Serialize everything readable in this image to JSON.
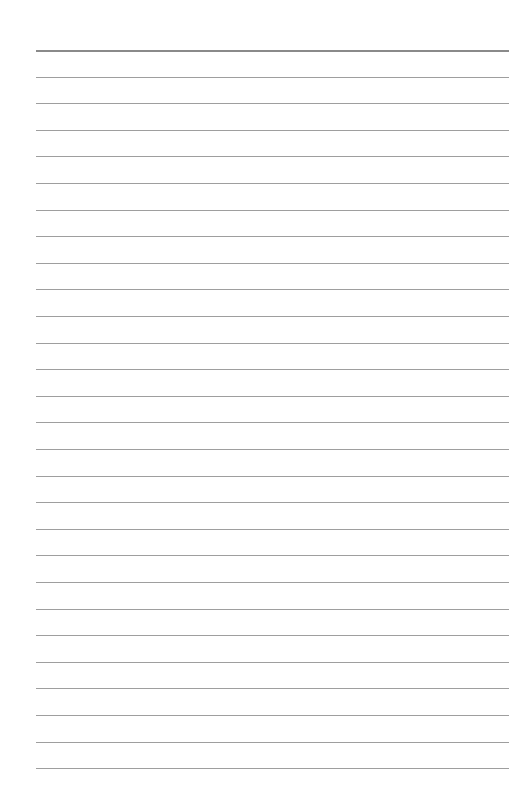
{
  "page": {
    "background_color": "#ffffff",
    "width": 513,
    "height": 793,
    "content_text": "",
    "orientation": "portrait"
  },
  "ruling": {
    "type": "horizontal-ruled-lines",
    "line_count": 28,
    "left_margin_px": 36,
    "right_edge_px": 509,
    "line_length_px": 473,
    "first_line_y_px": 50,
    "line_spacing_px": 26.6,
    "header_rule": {
      "index": 0,
      "y_px": 50,
      "thickness_px": 2,
      "color": "#8a8a8a",
      "label": "header-rule"
    },
    "body_rule_style": {
      "thickness_px": 1,
      "color": "#9e9e9e"
    },
    "lines": [
      {
        "index": 0,
        "y": 50.0,
        "type": "header",
        "color": "#8a8a8a",
        "thickness": 2,
        "text": ""
      },
      {
        "index": 1,
        "y": 76.6,
        "type": "body",
        "color": "#9e9e9e",
        "thickness": 1,
        "text": ""
      },
      {
        "index": 2,
        "y": 103.2,
        "type": "body",
        "color": "#9e9e9e",
        "thickness": 1,
        "text": ""
      },
      {
        "index": 3,
        "y": 129.8,
        "type": "body",
        "color": "#9e9e9e",
        "thickness": 1,
        "text": ""
      },
      {
        "index": 4,
        "y": 156.4,
        "type": "body",
        "color": "#9e9e9e",
        "thickness": 1,
        "text": ""
      },
      {
        "index": 5,
        "y": 183.0,
        "type": "body",
        "color": "#9e9e9e",
        "thickness": 1,
        "text": ""
      },
      {
        "index": 6,
        "y": 209.6,
        "type": "body",
        "color": "#9e9e9e",
        "thickness": 1,
        "text": ""
      },
      {
        "index": 7,
        "y": 236.2,
        "type": "body",
        "color": "#9e9e9e",
        "thickness": 1,
        "text": ""
      },
      {
        "index": 8,
        "y": 262.8,
        "type": "body",
        "color": "#9e9e9e",
        "thickness": 1,
        "text": ""
      },
      {
        "index": 9,
        "y": 289.4,
        "type": "body",
        "color": "#9e9e9e",
        "thickness": 1,
        "text": ""
      },
      {
        "index": 10,
        "y": 316.0,
        "type": "body",
        "color": "#9e9e9e",
        "thickness": 1,
        "text": ""
      },
      {
        "index": 11,
        "y": 342.6,
        "type": "body",
        "color": "#9e9e9e",
        "thickness": 1,
        "text": ""
      },
      {
        "index": 12,
        "y": 369.2,
        "type": "body",
        "color": "#9e9e9e",
        "thickness": 1,
        "text": ""
      },
      {
        "index": 13,
        "y": 395.8,
        "type": "body",
        "color": "#9e9e9e",
        "thickness": 1,
        "text": ""
      },
      {
        "index": 14,
        "y": 422.4,
        "type": "body",
        "color": "#9e9e9e",
        "thickness": 1,
        "text": ""
      },
      {
        "index": 15,
        "y": 449.0,
        "type": "body",
        "color": "#9e9e9e",
        "thickness": 1,
        "text": ""
      },
      {
        "index": 16,
        "y": 475.6,
        "type": "body",
        "color": "#9e9e9e",
        "thickness": 1,
        "text": ""
      },
      {
        "index": 17,
        "y": 502.2,
        "type": "body",
        "color": "#9e9e9e",
        "thickness": 1,
        "text": ""
      },
      {
        "index": 18,
        "y": 528.8,
        "type": "body",
        "color": "#9e9e9e",
        "thickness": 1,
        "text": ""
      },
      {
        "index": 19,
        "y": 555.4,
        "type": "body",
        "color": "#9e9e9e",
        "thickness": 1,
        "text": ""
      },
      {
        "index": 20,
        "y": 582.0,
        "type": "body",
        "color": "#9e9e9e",
        "thickness": 1,
        "text": ""
      },
      {
        "index": 21,
        "y": 608.6,
        "type": "body",
        "color": "#9e9e9e",
        "thickness": 1,
        "text": ""
      },
      {
        "index": 22,
        "y": 635.2,
        "type": "body",
        "color": "#9e9e9e",
        "thickness": 1,
        "text": ""
      },
      {
        "index": 23,
        "y": 661.8,
        "type": "body",
        "color": "#9e9e9e",
        "thickness": 1,
        "text": ""
      },
      {
        "index": 24,
        "y": 688.4,
        "type": "body",
        "color": "#9e9e9e",
        "thickness": 1,
        "text": ""
      },
      {
        "index": 25,
        "y": 715.0,
        "type": "body",
        "color": "#9e9e9e",
        "thickness": 1,
        "text": ""
      },
      {
        "index": 26,
        "y": 741.6,
        "type": "body",
        "color": "#9e9e9e",
        "thickness": 1,
        "text": ""
      },
      {
        "index": 27,
        "y": 768.2,
        "type": "body",
        "color": "#9e9e9e",
        "thickness": 1,
        "text": ""
      }
    ]
  }
}
